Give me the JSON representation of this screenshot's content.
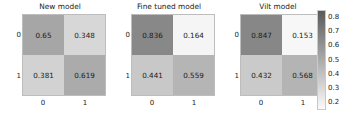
{
  "figure": {
    "background": "#ffffff",
    "colormap": "gray_reversed"
  },
  "chart_data": {
    "type": "heatmap",
    "title": "",
    "subtitle": "",
    "panels": [
      {
        "title": "New model",
        "xlabel": "",
        "ylabel": "",
        "x_ticks": [
          "0",
          "1"
        ],
        "y_ticks": [
          "0",
          "1"
        ],
        "values": [
          [
            0.65,
            0.348
          ],
          [
            0.381,
            0.619
          ]
        ],
        "labels": [
          [
            "0.65",
            "0.348"
          ],
          [
            "0.381",
            "0.619"
          ]
        ]
      },
      {
        "title": "Fine tuned model",
        "xlabel": "",
        "ylabel": "",
        "x_ticks": [
          "0",
          "1"
        ],
        "y_ticks": [
          "0",
          "1"
        ],
        "values": [
          [
            0.836,
            0.164
          ],
          [
            0.441,
            0.559
          ]
        ],
        "labels": [
          [
            "0.836",
            "0.164"
          ],
          [
            "0.441",
            "0.559"
          ]
        ]
      },
      {
        "title": "Vilt model",
        "xlabel": "",
        "ylabel": "",
        "x_ticks": [
          "0",
          "1"
        ],
        "y_ticks": [
          "0",
          "1"
        ],
        "values": [
          [
            0.847,
            0.153
          ],
          [
            0.432,
            0.568
          ]
        ],
        "labels": [
          [
            "0.847",
            "0.153"
          ],
          [
            "0.432",
            "0.568"
          ]
        ]
      }
    ],
    "colorbar": {
      "ticks": [
        "0.8",
        "0.7",
        "0.6",
        "0.5",
        "0.4",
        "0.3",
        "0.2"
      ],
      "vmin": 0.153,
      "vmax": 0.847,
      "orientation": "vertical",
      "position": "right"
    },
    "grid": false,
    "legend": "none"
  }
}
